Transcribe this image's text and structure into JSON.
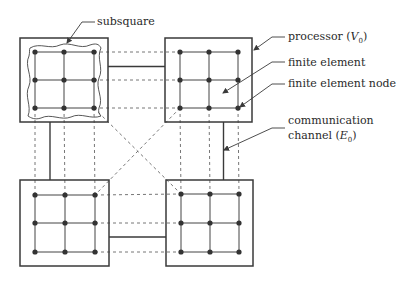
{
  "diagram": {
    "type": "processor-grid-partition",
    "colors": {
      "stroke": "#3a3a3a",
      "node": "#333333",
      "dashed": "#555555",
      "background": "#ffffff"
    },
    "processors": [
      {
        "id": "top-left",
        "box": [
          20,
          38,
          88,
          84
        ],
        "nodes_x": [
          35,
          64,
          94
        ],
        "nodes_y": [
          52,
          80,
          108
        ],
        "has_subsquare": true
      },
      {
        "id": "top-right",
        "box": [
          165,
          38,
          87,
          84
        ],
        "nodes_x": [
          180,
          209,
          238
        ],
        "nodes_y": [
          52,
          80,
          108
        ],
        "has_subsquare": false
      },
      {
        "id": "bottom-left",
        "box": [
          20,
          180,
          89,
          86
        ],
        "nodes_x": [
          35,
          65,
          95
        ],
        "nodes_y": [
          195,
          223,
          252
        ],
        "has_subsquare": false
      },
      {
        "id": "bottom-right",
        "box": [
          166,
          180,
          87,
          86
        ],
        "nodes_x": [
          181,
          210,
          239
        ],
        "nodes_y": [
          194,
          223,
          252
        ],
        "has_subsquare": false
      }
    ],
    "channels": [
      {
        "from": "top-left",
        "to": "top-right",
        "orientation": "horizontal"
      },
      {
        "from": "top-left",
        "to": "bottom-left",
        "orientation": "vertical"
      },
      {
        "from": "top-right",
        "to": "bottom-right",
        "orientation": "vertical"
      },
      {
        "from": "bottom-left",
        "to": "bottom-right",
        "orientation": "horizontal"
      }
    ],
    "labels": {
      "subsquare": "subsquare",
      "processor": "processor (",
      "processor_symbol": "V",
      "processor_sub": "0",
      "processor_close": ")",
      "finite_element": "finite element",
      "finite_element_node": "finite element node",
      "communication_line1": "communication",
      "communication_line2": "channel (",
      "communication_symbol": "E",
      "communication_sub": "0",
      "communication_close": ")"
    }
  }
}
